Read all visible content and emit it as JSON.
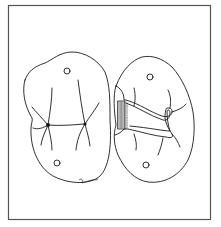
{
  "figure": {
    "type": "dental line illustration",
    "views": [
      {
        "id": "left-tooth",
        "label": "Occlusal view of molar with central groove",
        "features": [
          "outline",
          "central-groove",
          "pits",
          "cusp-ridges",
          "contact-circle-top",
          "contact-circle-bottom"
        ]
      },
      {
        "id": "right-tooth",
        "label": "Occlusal view of molar with prepared cavity outline",
        "features": [
          "outline",
          "cavity-preparation",
          "hatched-proximal-box",
          "cusp-ridges",
          "contact-circle-top",
          "contact-circle-bottom"
        ]
      }
    ],
    "signature": "Bradley",
    "colors": {
      "background": "#ffffff",
      "line": "#1a1a1a",
      "frame": "#555555"
    }
  }
}
